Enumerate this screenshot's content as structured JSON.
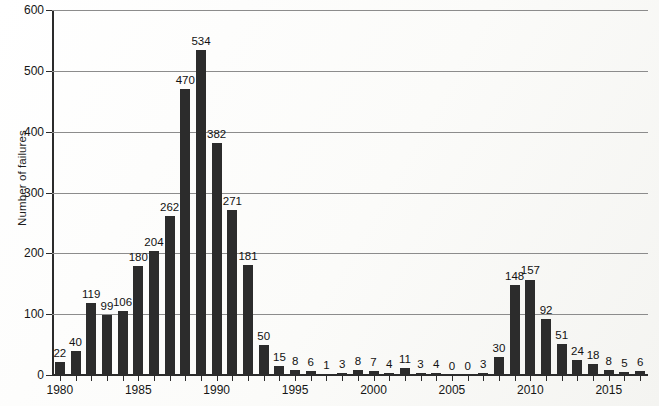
{
  "chart_data": {
    "type": "bar",
    "title": "",
    "subtitle": "",
    "xlabel": "",
    "ylabel": "Number of failures",
    "ylim": [
      0,
      600
    ],
    "ytick_values": [
      0,
      100,
      200,
      300,
      400,
      500,
      600
    ],
    "ytick_labels": [
      "0",
      "100",
      "200",
      "300",
      "400",
      "500",
      "600"
    ],
    "xlim": [
      1979.5,
      2017.5
    ],
    "xtick_labels": [
      "1980",
      "1985",
      "1990",
      "1995",
      "2000",
      "2005",
      "2010",
      "2015"
    ],
    "xtick_values": [
      1980,
      1985,
      1990,
      1995,
      2000,
      2005,
      2010,
      2015
    ],
    "grid": "horizontal",
    "legend": "none",
    "bar_color": "#2c2c2c",
    "gridline_color": "#8c8c8c",
    "axis_color": "#2b2b2b",
    "background_color": "#fdfdfc",
    "data_labels_shown": true,
    "categories": [
      "1980",
      "1981",
      "1982",
      "1983",
      "1984",
      "1985",
      "1986",
      "1987",
      "1988",
      "1989",
      "1990",
      "1991",
      "1992",
      "1993",
      "1994",
      "1995",
      "1996",
      "1997",
      "1998",
      "1999",
      "2000",
      "2001",
      "2002",
      "2003",
      "2004",
      "2005",
      "2006",
      "2007",
      "2008",
      "2009",
      "2010",
      "2011",
      "2012",
      "2013",
      "2014",
      "2015",
      "2016",
      "2017"
    ],
    "values": [
      22,
      40,
      119,
      99,
      106,
      180,
      204,
      262,
      470,
      534,
      382,
      271,
      181,
      50,
      15,
      8,
      6,
      1,
      3,
      8,
      7,
      4,
      11,
      3,
      4,
      0,
      0,
      3,
      30,
      148,
      157,
      92,
      51,
      24,
      18,
      8,
      5,
      6
    ],
    "value_labels": [
      "22",
      "40",
      "119",
      "99",
      "106",
      "180",
      "204",
      "262",
      "470",
      "534",
      "382",
      "271",
      "181",
      "50",
      "15",
      "8",
      "6",
      "1",
      "3",
      "8",
      "7",
      "4",
      "11",
      "3",
      "4",
      "0",
      "0",
      "3",
      "30",
      "148",
      "157",
      "92",
      "51",
      "24",
      "18",
      "8",
      "5",
      "6"
    ]
  }
}
